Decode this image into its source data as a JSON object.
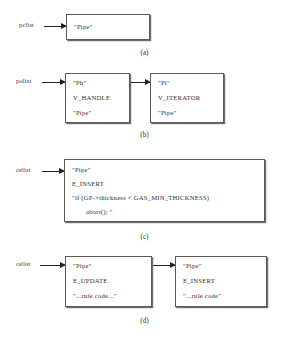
{
  "figure": {
    "panels": [
      {
        "id": "a",
        "caption": "(a)",
        "pointer_label": "pclist",
        "boxes": [
          {
            "id": "a1",
            "lines": [
              "\"Pipe\""
            ]
          }
        ]
      },
      {
        "id": "b",
        "caption": "(b)",
        "pointer_label": "polist",
        "boxes": [
          {
            "id": "b1",
            "lines": [
              "\"Ph\"",
              "V_HANDLE",
              "\"Pipe\""
            ]
          },
          {
            "id": "b2",
            "lines": [
              "\"Pi\"",
              "V_ITERATOR",
              "\"Pipe\""
            ]
          }
        ]
      },
      {
        "id": "c",
        "caption": "(c)",
        "pointer_label": "celist",
        "boxes": [
          {
            "id": "c1",
            "lines": [
              "\"Pipe\"",
              "E_INSERT",
              "\"if (GP->thickness < GAS_MIN_THICKNESS)",
              "abort(); \""
            ]
          }
        ]
      },
      {
        "id": "d",
        "caption": "(d)",
        "pointer_label": "celist",
        "boxes": [
          {
            "id": "d1",
            "lines": [
              "\"Pipe\"",
              "E_UPDATE",
              "\"...rule code...\""
            ]
          },
          {
            "id": "d2",
            "lines": [
              "\"Pipe\"",
              "E_INSERT",
              "\"...rule code\""
            ]
          }
        ]
      }
    ]
  }
}
